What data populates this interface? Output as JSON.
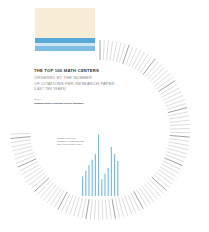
{
  "title": "THE TOP 100 MATH CENTERS",
  "subtitle_lines": [
    "ORDERED BY THE NUMBER",
    "OF CITATIONS PER RESEARCH PAPER",
    "(LAST TEN YEARS)"
  ],
  "source_label": "Source:",
  "source": "Thomson Reuters, Essential Science Indicators",
  "note": "Number of papers published in listed journals with a high citation index",
  "colors": {
    "beige": "#f7ecd6",
    "blue": "#5aa8d8",
    "light_blue": "#cfe6f5",
    "bar": "#7fbde5",
    "highlight": "#d04a3a"
  },
  "chart_data": {
    "type": "bar",
    "layout": "radial",
    "series": [
      {
        "name": "Papers (selected centers)",
        "values": [
          14,
          18,
          22,
          26,
          30,
          44,
          12,
          16,
          20,
          35,
          30,
          25
        ]
      }
    ],
    "n_centers": 100
  }
}
